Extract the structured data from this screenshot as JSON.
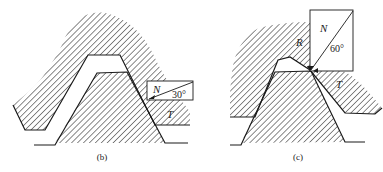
{
  "figure": {
    "panels": [
      {
        "id": "b",
        "caption": "(b)",
        "box_labels": {
          "normal": "N",
          "angle": "30°"
        },
        "force_labels": {
          "tangential": "T"
        }
      },
      {
        "id": "c",
        "caption": "(c)",
        "box_labels": {
          "normal": "N",
          "angle": "60°"
        },
        "force_labels": {
          "resultant": "R",
          "tangential": "T"
        }
      }
    ],
    "colors": {
      "line": "#1a1a1a",
      "hatch": "#2a2a2a",
      "background": "#ffffff"
    }
  }
}
